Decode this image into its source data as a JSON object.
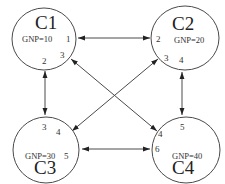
{
  "diagram": {
    "type": "network-graph",
    "nodes": [
      {
        "id": "C1",
        "label": "C1",
        "gnp": "GNP=10",
        "ports": [
          "1",
          "2",
          "3"
        ]
      },
      {
        "id": "C2",
        "label": "C2",
        "gnp": "GNP=20",
        "ports": [
          "2",
          "3",
          "4"
        ]
      },
      {
        "id": "C3",
        "label": "C3",
        "gnp": "GNP=30",
        "ports": [
          "3",
          "4",
          "5"
        ]
      },
      {
        "id": "C4",
        "label": "C4",
        "gnp": "GNP=40",
        "ports": [
          "4",
          "5",
          "6"
        ]
      }
    ],
    "edges": [
      {
        "from": "C1",
        "from_port": "1",
        "to": "C2",
        "to_port": "2",
        "direction": "bidirectional"
      },
      {
        "from": "C1",
        "from_port": "2",
        "to": "C3",
        "to_port": "3",
        "direction": "bidirectional"
      },
      {
        "from": "C1",
        "from_port": "3",
        "to": "C4",
        "to_port": "4",
        "direction": "bidirectional"
      },
      {
        "from": "C2",
        "from_port": "3",
        "to": "C3",
        "to_port": "4",
        "direction": "bidirectional"
      },
      {
        "from": "C2",
        "from_port": "4",
        "to": "C4",
        "to_port": "5",
        "direction": "bidirectional"
      },
      {
        "from": "C3",
        "from_port": "5",
        "to": "C4",
        "to_port": "6",
        "direction": "bidirectional"
      }
    ],
    "colors": {
      "stroke": "#4a4a4a",
      "background": "#ffffff",
      "text": "#222222"
    }
  }
}
